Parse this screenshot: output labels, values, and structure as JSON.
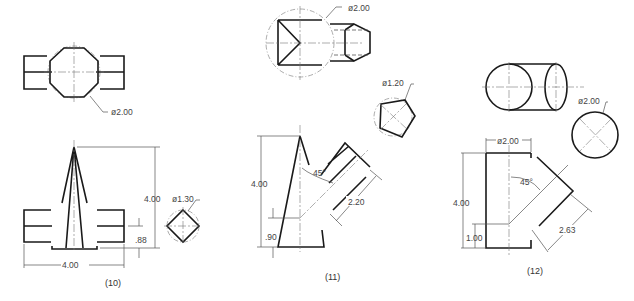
{
  "figures": [
    {
      "id": "fig10",
      "caption": "(10)",
      "labels": {
        "top_diameter": "ø2.00",
        "height": "4.00",
        "small_diameter": "ø1.30",
        "offset": ".88",
        "width": "4.00"
      }
    },
    {
      "id": "fig11",
      "caption": "(11)",
      "labels": {
        "top_diameter": "ø2.00",
        "small_diameter": "ø1.20",
        "height": "4.00",
        "angle": "45°",
        "branch_length": "2.20",
        "offset": ".90"
      }
    },
    {
      "id": "fig12",
      "caption": "(12)",
      "labels": {
        "side_diameter": "ø2.00",
        "top_diameter": "ø2.00",
        "height": "4.00",
        "angle": "45°",
        "branch_length": "2.63",
        "offset": "1.00"
      }
    }
  ]
}
